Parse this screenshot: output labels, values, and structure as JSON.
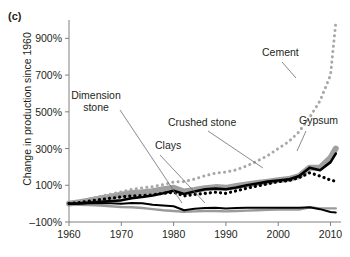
{
  "figure": {
    "panel_label": "(c)",
    "ylabel": "Change in production since 1960"
  },
  "chart_data": {
    "type": "line",
    "title": "",
    "xlabel": "",
    "ylabel": "Change in production since 1960",
    "xlim": [
      1960,
      2012
    ],
    "ylim": [
      -100,
      1000
    ],
    "yticks": [
      -100,
      100,
      300,
      500,
      700,
      900
    ],
    "ytick_labels": [
      "–100%",
      "100%",
      "300%",
      "500%",
      "700%",
      "900%"
    ],
    "xticks": [
      1960,
      1970,
      1980,
      1990,
      2000,
      2010
    ],
    "xtick_labels": [
      "1960",
      "1970",
      "1980",
      "1990",
      "2000",
      "2010"
    ],
    "grid": false,
    "legend": "annotations",
    "annotations": [
      {
        "label": "Cement",
        "x": 262,
        "y": 56,
        "series": "Cement"
      },
      {
        "label": "Gypsum",
        "x": 299,
        "y": 124,
        "series": "Gypsum"
      },
      {
        "label": "Crushed stone",
        "x": 168,
        "y": 126,
        "series": "Crushed stone"
      },
      {
        "label": "Clays",
        "x": 155,
        "y": 149,
        "series": "Clays"
      },
      {
        "label": "Dimension stone",
        "x": 96,
        "y": 99,
        "series": "Dimension stone"
      }
    ],
    "series": [
      {
        "name": "Cement",
        "style": "dotted",
        "color": "#a8a8a8",
        "x": [
          1960,
          1962,
          1964,
          1966,
          1968,
          1970,
          1972,
          1974,
          1976,
          1978,
          1980,
          1982,
          1984,
          1986,
          1988,
          1990,
          1992,
          1994,
          1996,
          1998,
          2000,
          2002,
          2004,
          2006,
          2008,
          2010,
          2011
        ],
        "values": [
          0,
          12,
          26,
          40,
          52,
          64,
          78,
          86,
          92,
          104,
          118,
          120,
          134,
          152,
          166,
          172,
          184,
          206,
          232,
          262,
          300,
          338,
          392,
          470,
          560,
          700,
          985
        ]
      },
      {
        "name": "Gypsum",
        "style": "solid-thick",
        "color": "#000000",
        "x": [
          1960,
          1962,
          1964,
          1966,
          1968,
          1970,
          1972,
          1974,
          1976,
          1978,
          1980,
          1982,
          1984,
          1986,
          1988,
          1990,
          1992,
          1994,
          1996,
          1998,
          2000,
          2002,
          2004,
          2006,
          2008,
          2010,
          2011
        ],
        "values": [
          0,
          2,
          6,
          10,
          14,
          18,
          30,
          36,
          44,
          56,
          70,
          52,
          66,
          78,
          82,
          78,
          88,
          100,
          110,
          120,
          126,
          132,
          150,
          196,
          182,
          226,
          272
        ]
      },
      {
        "name": "Crushed stone",
        "style": "band",
        "color": "#a0a0a0",
        "x": [
          1960,
          1962,
          1964,
          1966,
          1968,
          1970,
          1972,
          1974,
          1976,
          1978,
          1980,
          1982,
          1984,
          1986,
          1988,
          1990,
          1992,
          1994,
          1996,
          1998,
          2000,
          2002,
          2004,
          2006,
          2008,
          2010,
          2011
        ],
        "values": [
          0,
          8,
          18,
          28,
          38,
          48,
          58,
          62,
          68,
          78,
          86,
          66,
          74,
          84,
          90,
          86,
          96,
          104,
          112,
          120,
          128,
          134,
          150,
          196,
          196,
          250,
          300
        ]
      },
      {
        "name": "Clays",
        "style": "dotted-thick",
        "color": "#000000",
        "x": [
          1960,
          1962,
          1964,
          1966,
          1968,
          1970,
          1972,
          1974,
          1976,
          1978,
          1980,
          1982,
          1984,
          1986,
          1988,
          1990,
          1992,
          1994,
          1996,
          1998,
          2000,
          2002,
          2004,
          2006,
          2008,
          2010,
          2011
        ],
        "values": [
          0,
          6,
          14,
          22,
          30,
          36,
          42,
          44,
          48,
          56,
          62,
          42,
          50,
          56,
          62,
          56,
          70,
          84,
          96,
          108,
          120,
          126,
          142,
          168,
          150,
          128,
          122
        ]
      },
      {
        "name": "Dimension stone",
        "style": "solid-medium",
        "color": "#000000",
        "x": [
          1960,
          1962,
          1964,
          1966,
          1968,
          1970,
          1972,
          1974,
          1976,
          1978,
          1980,
          1982,
          1984,
          1986,
          1988,
          1990,
          1992,
          1994,
          1996,
          1998,
          2000,
          2002,
          2004,
          2006,
          2008,
          2010,
          2011
        ],
        "values": [
          -2,
          0,
          2,
          4,
          2,
          0,
          4,
          2,
          -6,
          -10,
          -14,
          -36,
          -28,
          -24,
          -22,
          -26,
          -24,
          -22,
          -22,
          -22,
          -22,
          -22,
          -22,
          -20,
          -30,
          -46,
          -48
        ]
      },
      {
        "name": "Lower gray series",
        "style": "solid-gray",
        "color": "#9a9a9a",
        "x": [
          1960,
          1962,
          1964,
          1966,
          1968,
          1970,
          1972,
          1974,
          1976,
          1978,
          1980,
          1982,
          1984,
          1986,
          1988,
          1990,
          1992,
          1994,
          1996,
          1998,
          2000,
          2002,
          2004,
          2006,
          2008,
          2010,
          2011
        ],
        "values": [
          -4,
          -6,
          -8,
          -10,
          -14,
          -18,
          -20,
          -24,
          -30,
          -36,
          -40,
          -44,
          -42,
          -40,
          -40,
          -42,
          -40,
          -38,
          -36,
          -34,
          -32,
          -32,
          -32,
          -20,
          -26,
          -26,
          -26
        ]
      }
    ]
  }
}
